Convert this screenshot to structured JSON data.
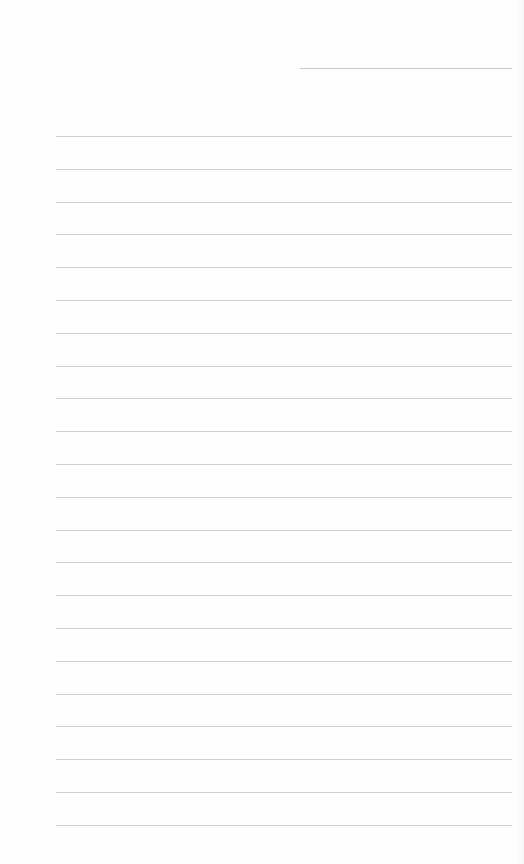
{
  "document": {
    "type": "lined-paper",
    "header_line": {
      "x": 300,
      "y": 68,
      "width": 212
    },
    "rules": {
      "x": 56,
      "width": 456,
      "start_y": 136,
      "spacing": 32.8,
      "count": 22
    },
    "colors": {
      "paper": "#fefefe",
      "line": "#cfcfcf"
    }
  }
}
